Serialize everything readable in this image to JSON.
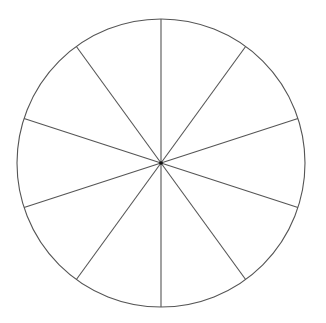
{
  "diagram": {
    "type": "divided-circle",
    "canvas": {
      "width": 326,
      "height": 323
    },
    "center": {
      "x": 161,
      "y": 163
    },
    "radius": 144,
    "segments": 10,
    "start_angle_deg": 0,
    "colors": {
      "background": "#ffffff",
      "stroke": "#555555",
      "center_dot": "#111111"
    },
    "stroke_width": 1.1,
    "center_dot_radius": 1.8
  }
}
